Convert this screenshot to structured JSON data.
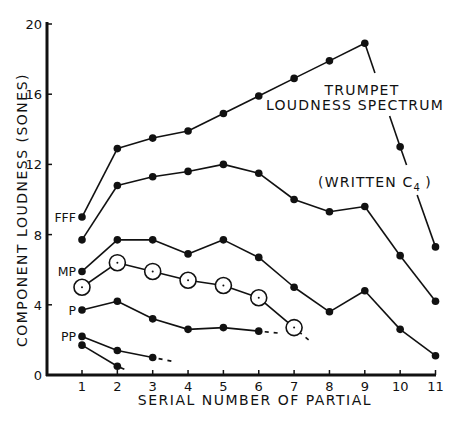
{
  "chart_data": {
    "type": "line",
    "title": "Trumpet Loudness Spectrum (Written C4)",
    "annotations": [
      {
        "text": "TRUMPET",
        "x": 360,
        "y": 95
      },
      {
        "text": "LOUDNESS SPECTRUM",
        "x": 355,
        "y": 110
      },
      {
        "text": "(WRITTEN C",
        "sub": "4",
        "suffix": " )",
        "x": 372,
        "y": 187
      }
    ],
    "xlabel": "SERIAL NUMBER OF PARTIAL",
    "ylabel": "COMPONENT LOUDNESS   (SONES)",
    "xlim": [
      1,
      11
    ],
    "ylim": [
      0,
      20
    ],
    "x_ticks": [
      1,
      2,
      3,
      4,
      5,
      6,
      7,
      8,
      9,
      10,
      11
    ],
    "y_ticks": [
      0,
      4,
      8,
      12,
      16,
      20
    ],
    "grid": false,
    "legend": "none (series labeled inline at left)",
    "series": [
      {
        "name": "FFF",
        "label": "FFF",
        "marker": "filled",
        "x": [
          1,
          2,
          3,
          4,
          5,
          6,
          7,
          8,
          9,
          10,
          11
        ],
        "values": [
          9.0,
          12.9,
          13.5,
          13.9,
          14.9,
          15.9,
          16.9,
          17.9,
          18.9,
          13.0,
          7.3
        ]
      },
      {
        "name": "FFF (second)",
        "label": "",
        "marker": "filled",
        "x": [
          1,
          2,
          3,
          4,
          5,
          6,
          7,
          8,
          9,
          10,
          11
        ],
        "values": [
          7.7,
          10.8,
          11.3,
          11.6,
          12.0,
          11.5,
          10.0,
          9.3,
          9.6,
          6.8,
          4.2
        ]
      },
      {
        "name": "MP",
        "label": "MP",
        "marker": "filled",
        "x": [
          1,
          2,
          3,
          4,
          5,
          6,
          7,
          8,
          9,
          10,
          11
        ],
        "values": [
          5.9,
          7.7,
          7.7,
          6.9,
          7.7,
          6.7,
          5.0,
          3.6,
          4.8,
          2.6,
          1.1
        ]
      },
      {
        "name": "MP (open circles)",
        "label": "",
        "marker": "open",
        "x": [
          1,
          2,
          3,
          4,
          5,
          6,
          7
        ],
        "values": [
          5.0,
          6.4,
          5.9,
          5.4,
          5.1,
          4.4,
          2.7
        ],
        "dashed_tail": true
      },
      {
        "name": "P",
        "label": "P",
        "marker": "filled",
        "x": [
          1,
          2,
          3,
          4,
          5,
          6
        ],
        "values": [
          3.7,
          4.2,
          3.2,
          2.6,
          2.7,
          2.5
        ],
        "dashed_tail": true
      },
      {
        "name": "PP",
        "label": "PP",
        "marker": "filled",
        "x": [
          1,
          2,
          3
        ],
        "values": [
          2.2,
          1.4,
          1.0
        ],
        "dashed_tail": true
      },
      {
        "name": "PP (second)",
        "label": "",
        "marker": "filled",
        "x": [
          1,
          2
        ],
        "values": [
          1.7,
          0.5
        ],
        "dashed_tail": false
      }
    ]
  },
  "layout": {
    "plot_left": 47,
    "plot_right": 436,
    "x1_px": 82,
    "x_step_px": 35.35,
    "y0_px": 375,
    "y_px_per_unit": 17.55
  },
  "labels": {
    "xlabel": "SERIAL NUMBER OF PARTIAL",
    "ylabel": "COMPONENT LOUDNESS   (SONES)",
    "annot_line1": "TRUMPET",
    "annot_line2": "LOUDNESS SPECTRUM",
    "annot_line3": "(WRITTEN C",
    "annot_sub": "4",
    "annot_close": ")"
  },
  "colors": {
    "ink": "#111111",
    "background": "#ffffff"
  }
}
